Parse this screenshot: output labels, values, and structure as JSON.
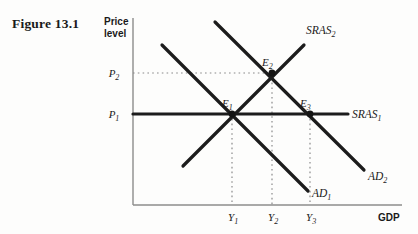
{
  "figure": {
    "title": "Figure 13.1"
  },
  "axes": {
    "y_label_line1": "Price",
    "y_label_line2": "level",
    "x_label": "GDP",
    "y_ticks": [
      {
        "id": "P2",
        "base": "P",
        "sub": "2",
        "value_y": 73
      },
      {
        "id": "P1",
        "base": "P",
        "sub": "1",
        "value_y": 114
      }
    ],
    "x_ticks": [
      {
        "id": "Y1",
        "base": "Y",
        "sub": "1",
        "value_x": 232
      },
      {
        "id": "Y2",
        "base": "Y",
        "sub": "2",
        "value_x": 272
      },
      {
        "id": "Y3",
        "base": "Y",
        "sub": "3",
        "value_x": 310
      }
    ]
  },
  "curves": [
    {
      "id": "AD1",
      "base": "AD",
      "sub": "1",
      "label_x": 312,
      "label_y": 197,
      "x1": 162,
      "y1": 45,
      "x2": 308,
      "y2": 191
    },
    {
      "id": "AD2",
      "base": "AD",
      "sub": "2",
      "label_x": 368,
      "label_y": 180,
      "x1": 215,
      "y1": 22,
      "x2": 364,
      "y2": 170
    },
    {
      "id": "SRAS1",
      "base": "SRAS",
      "sub": "1",
      "label_x": 352,
      "label_y": 118,
      "x1": 133,
      "y1": 114,
      "x2": 348,
      "y2": 114
    },
    {
      "id": "SRAS2",
      "base": "SRAS",
      "sub": "2",
      "label_x": 306,
      "label_y": 34,
      "x1": 183,
      "y1": 166,
      "x2": 304,
      "y2": 45
    }
  ],
  "equilibria": [
    {
      "id": "E1",
      "base": "E",
      "sub": "1",
      "x": 232,
      "y": 114,
      "label_x": 222,
      "label_y": 106
    },
    {
      "id": "E2",
      "base": "E",
      "sub": "2",
      "x": 272,
      "y": 73,
      "label_x": 262,
      "label_y": 65
    },
    {
      "id": "E3",
      "base": "E",
      "sub": "3",
      "x": 310,
      "y": 114,
      "label_x": 300,
      "label_y": 106
    }
  ],
  "guides": [
    {
      "id": "guide-P2-horizontal",
      "x1": 133,
      "y1": 73,
      "x2": 272,
      "y2": 73
    },
    {
      "id": "guide-Y1-vertical",
      "x1": 232,
      "y1": 114,
      "x2": 232,
      "y2": 205
    },
    {
      "id": "guide-Y2-vertical",
      "x1": 272,
      "y1": 73,
      "x2": 272,
      "y2": 205
    },
    {
      "id": "guide-Y3-vertical",
      "x1": 310,
      "y1": 114,
      "x2": 310,
      "y2": 205
    }
  ],
  "colors": {
    "background": "#fdfdfc",
    "ink": "#1a1a1a",
    "curve": "#1c1c1c",
    "axis": "#808080",
    "guide": "#8a8a8a"
  }
}
